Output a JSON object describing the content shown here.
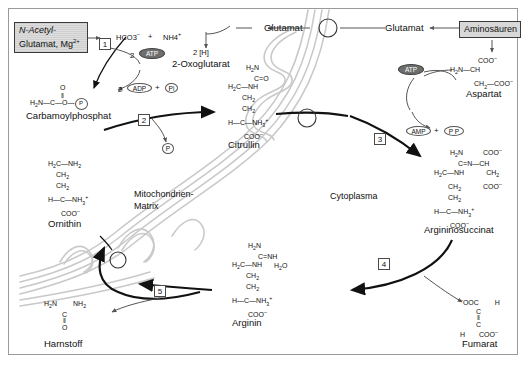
{
  "figure": {
    "language": "de"
  },
  "compartments": [
    {
      "id": "matrix",
      "label": "Mitochondrien-\nMatrix",
      "label_line1": "Mitochondrien-",
      "label_line2": "Matrix"
    },
    {
      "id": "cytoplasm",
      "label": "Cytoplasma"
    }
  ],
  "boxes": [
    {
      "id": "n-acetyl-glutamat",
      "line1": "N-Acetyl-",
      "line2": "Glutamat, Mg2+",
      "style": "hatched"
    },
    {
      "id": "aminosaeuren",
      "label": "Aminosäuren",
      "style": "gray"
    }
  ],
  "metabolites": {
    "bicarbonate": "HCO3",
    "bicarbonate_charge": "–",
    "ammonium": "NH4",
    "ammonium_charge": "+",
    "plus_sign": "+",
    "two_h": "2 [H]",
    "oxoglutarat": "2-Oxoglutarat",
    "glutamat_matrix": "Glutamat",
    "glutamat_cyto": "Glutamat",
    "carbamoylphosphat": "Carbamoylphosphat",
    "citrullin": "Citrullin",
    "ornithin": "Ornithin",
    "harnstoff": "Harnstoff",
    "arginin": "Arginin",
    "argininosuccinat": "Argininosuccinat",
    "fumarat": "Fumarat",
    "aspartat": "Aspartat",
    "water": "H2O"
  },
  "cofactors": [
    {
      "id": "atp-1",
      "count": "2",
      "label": "ATP",
      "style": "dark"
    },
    {
      "id": "adp-1",
      "count": "2",
      "label": "ADP",
      "style": "light"
    },
    {
      "id": "pi-1",
      "label": "Pi",
      "style": "light"
    },
    {
      "id": "pi-2",
      "label": "P",
      "style": "light"
    },
    {
      "id": "atp-2",
      "label": "ATP",
      "style": "dark"
    },
    {
      "id": "amp",
      "label": "AMP",
      "style": "light"
    },
    {
      "id": "ppi",
      "label": "P P",
      "style": "light"
    }
  ],
  "enzyme_steps": [
    {
      "number": "1",
      "name": "carbamoyl-phosphate-synthetase"
    },
    {
      "number": "2",
      "name": "ornithine-carbamoyltransferase"
    },
    {
      "number": "3",
      "name": "argininosuccinate-synthetase"
    },
    {
      "number": "4",
      "name": "argininosuccinate-lyase"
    },
    {
      "number": "5",
      "name": "arginase"
    }
  ],
  "structures": {
    "carbamoylphosphat": {
      "l1": "O",
      "l2": "||",
      "l3": "H2N—C—O— P"
    },
    "citrullin": {
      "l1": "H2N",
      "l2": "C=O",
      "l3": "H2C—NH",
      "l4": "CH2",
      "l5": "CH2",
      "l6": "H—C—NH3+",
      "l7": "COO–"
    },
    "ornithin": {
      "l1": "H2C—NH2",
      "l2": "CH2",
      "l3": "CH2",
      "l4": "H—C—NH3+",
      "l5": "COO–"
    },
    "arginin": {
      "l1": "H2N",
      "l2": "C=NH",
      "l3": "H2C—NH",
      "l4": "CH2",
      "l5": "CH2",
      "l6": "H—C—NH3+",
      "l7": "COO–",
      "water": "H2O"
    },
    "argininosuccinat": {
      "l1": "H2N",
      "l1r": "COO–",
      "l2": "C=N—CH",
      "l3": "H2C—NH",
      "l3r": "CH2",
      "l4": "CH2",
      "l4r": "COO–",
      "l5": "CH2",
      "l6": "H—C—NH3+",
      "l7": "COO–"
    },
    "aspartat": {
      "l1": "COO–",
      "l2": "H2N—CH",
      "l3": "CH2—COO–"
    },
    "harnstoff": {
      "l1": "H2N        NH2",
      "l2": "C",
      "l3": "||",
      "l4": "O"
    },
    "fumarat": {
      "l1": "–OOC        H",
      "l2": "C",
      "l3": "||",
      "l4": "C",
      "l5": "H        COO–"
    }
  },
  "colors": {
    "membrane": "#c9c9c9",
    "arrow": "#111111",
    "thin_arrow": "#6e6e6e",
    "box_fill": "#d8d8d8",
    "box_border": "#3a3a3a",
    "atp_fill": "#6e6e6e",
    "frame": "#9a9a9a",
    "text": "#111111"
  }
}
